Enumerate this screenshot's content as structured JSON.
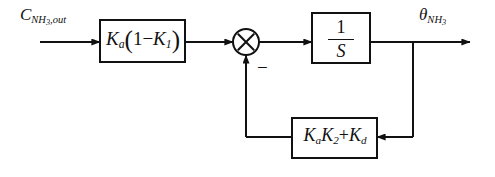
{
  "diagram": {
    "background_color": "#ffffff",
    "line_color": "#111111",
    "canvas": {
      "width": 495,
      "height": 177
    }
  },
  "signals": {
    "input": {
      "base": "C",
      "subscript_main": "NH",
      "subscript_number": "3",
      "subscript_tail": ",out",
      "full_text": "C_NH3,out"
    },
    "output": {
      "base": "θ",
      "subscript_main": "NH",
      "subscript_number": "3",
      "full_text": "θ_NH3"
    }
  },
  "blocks": {
    "gain_input": {
      "name": "forward gain block",
      "expr": {
        "k": "K",
        "k_sub": "a",
        "open_paren": "(",
        "one": "1",
        "minus": "−",
        "k2": "K",
        "k2_sub": "1",
        "close_paren": ")"
      },
      "text": "K_a(1 - K_1)"
    },
    "integrator": {
      "name": "integrator block",
      "numerator": "1",
      "denominator": "S",
      "text": "1/S"
    },
    "feedback_gain": {
      "name": "feedback gain block",
      "expr": {
        "k1": "K",
        "k1_sub": "a",
        "k2": "K",
        "k2_sub": "2",
        "plus": "+",
        "k3": "K",
        "k3_sub": "d"
      },
      "text": "K_aK_2 + K_d"
    }
  },
  "summing_junction": {
    "name": "summing junction",
    "style": "circle-with-cross",
    "feedback_sign": "−"
  }
}
